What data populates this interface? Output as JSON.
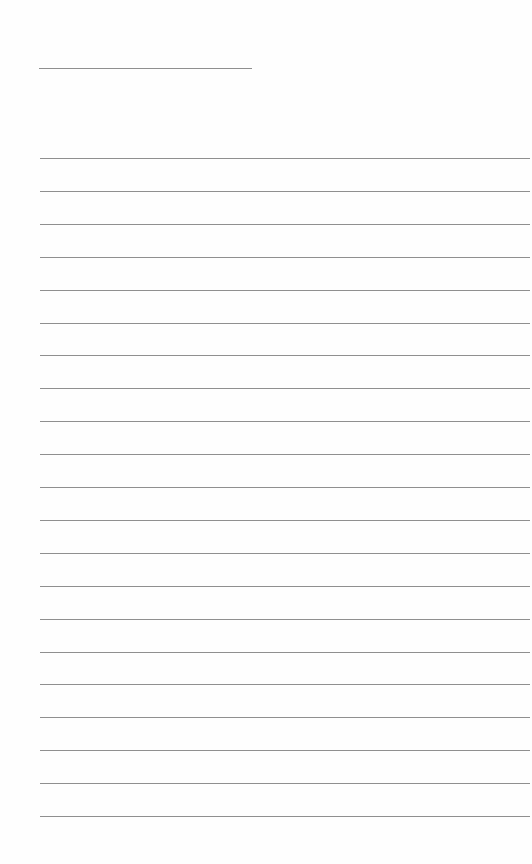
{
  "page": {
    "type": "lined-paper",
    "background": "#fefefe",
    "line_color": "#8f8f8f",
    "header_line": {
      "x": 39,
      "y": 68,
      "width": 213
    },
    "ruled_lines": {
      "count": 21,
      "start_y": 158,
      "spacing": 32.9,
      "left": 40
    }
  }
}
